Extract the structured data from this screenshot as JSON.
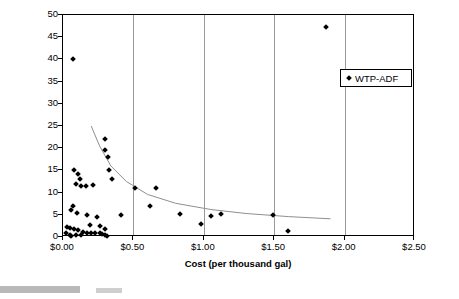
{
  "chart_data": {
    "type": "scatter",
    "title": "",
    "xlabel": "Cost (per thousand gal)",
    "ylabel": "System Size (WTP FLows - MGD)",
    "xlim": [
      0.0,
      2.5
    ],
    "ylim": [
      0,
      50
    ],
    "xticks": [
      "$0.00",
      "$0.50",
      "$1.00",
      "$1.50",
      "$2.00",
      "$2.50"
    ],
    "xtick_values": [
      0.0,
      0.5,
      1.0,
      1.5,
      2.0,
      2.5
    ],
    "yticks": [
      "0",
      "5",
      "10",
      "15",
      "20",
      "25",
      "30",
      "35",
      "40",
      "45",
      "50"
    ],
    "ytick_values": [
      0,
      5,
      10,
      15,
      20,
      25,
      30,
      35,
      40,
      45,
      50
    ],
    "grid": "vertical",
    "legend": {
      "position": "top-right",
      "entries": [
        "WTP-ADF"
      ]
    },
    "series": [
      {
        "name": "WTP-ADF",
        "marker": "diamond",
        "color": "#000000",
        "points": [
          [
            0.07,
            40.0
          ],
          [
            1.87,
            47.3
          ],
          [
            0.3,
            22.0
          ],
          [
            0.3,
            19.5
          ],
          [
            0.32,
            18.0
          ],
          [
            0.33,
            15.0
          ],
          [
            0.35,
            13.0
          ],
          [
            0.08,
            15.0
          ],
          [
            0.11,
            14.2
          ],
          [
            0.12,
            13.0
          ],
          [
            0.09,
            12.0
          ],
          [
            0.13,
            11.4
          ],
          [
            0.16,
            11.5
          ],
          [
            0.21,
            11.8
          ],
          [
            0.51,
            11.0
          ],
          [
            0.66,
            11.0
          ],
          [
            0.62,
            7.0
          ],
          [
            0.07,
            7.0
          ],
          [
            0.06,
            6.0
          ],
          [
            0.1,
            5.5
          ],
          [
            0.17,
            5.0
          ],
          [
            0.24,
            4.6
          ],
          [
            0.41,
            5.0
          ],
          [
            0.83,
            5.2
          ],
          [
            1.12,
            5.2
          ],
          [
            1.49,
            5.0
          ],
          [
            0.98,
            3.0
          ],
          [
            0.03,
            2.2
          ],
          [
            0.05,
            2.0
          ],
          [
            0.08,
            1.9
          ],
          [
            0.11,
            1.5
          ],
          [
            0.14,
            1.2
          ],
          [
            0.17,
            1.0
          ],
          [
            0.2,
            0.9
          ],
          [
            0.23,
            1.0
          ],
          [
            0.26,
            0.8
          ],
          [
            0.28,
            0.6
          ],
          [
            0.02,
            0.8
          ],
          [
            0.05,
            0.5
          ],
          [
            0.09,
            0.4
          ],
          [
            0.13,
            0.5
          ],
          [
            0.06,
            0.2
          ],
          [
            0.3,
            1.8
          ],
          [
            0.3,
            0.5
          ],
          [
            0.31,
            0.3
          ],
          [
            1.05,
            4.8
          ],
          [
            1.6,
            1.3
          ],
          [
            0.19,
            2.6
          ],
          [
            0.26,
            2.4
          ]
        ]
      }
    ],
    "trendline": {
      "name": "power-fit-curve",
      "color": "#8f8f8f",
      "points": [
        [
          0.2,
          25.0
        ],
        [
          0.26,
          20.5
        ],
        [
          0.34,
          16.0
        ],
        [
          0.45,
          12.5
        ],
        [
          0.6,
          9.6
        ],
        [
          0.8,
          7.6
        ],
        [
          1.05,
          6.2
        ],
        [
          1.3,
          5.3
        ],
        [
          1.6,
          4.6
        ],
        [
          1.9,
          4.1
        ]
      ]
    }
  }
}
